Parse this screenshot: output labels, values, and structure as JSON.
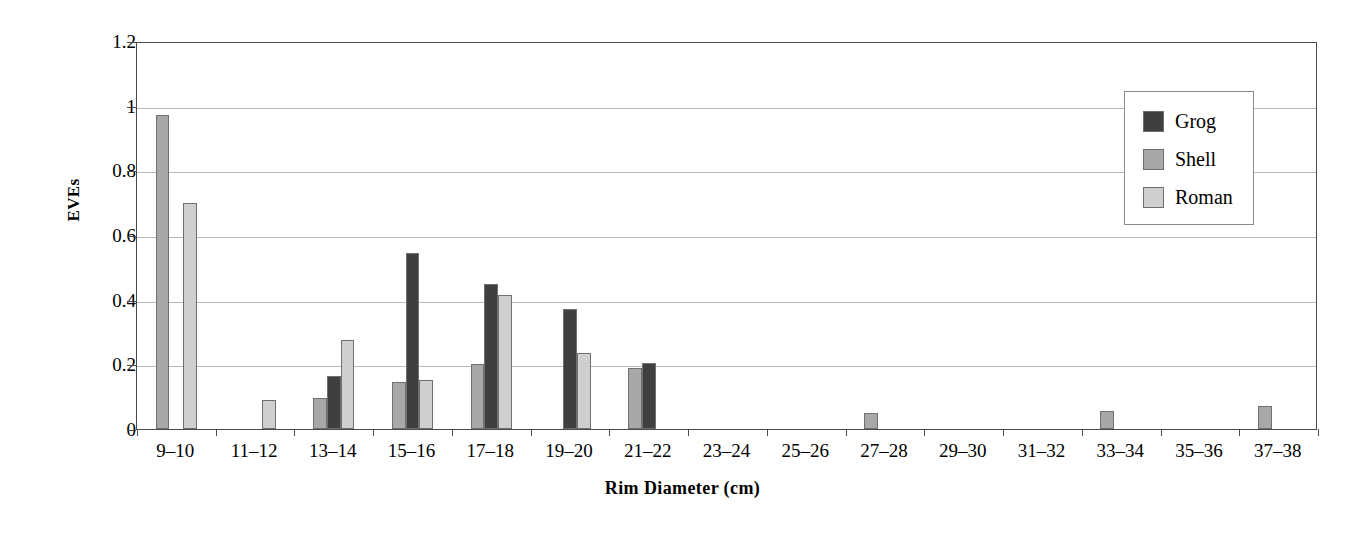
{
  "chart_data": {
    "type": "bar",
    "title": "",
    "xlabel": "Rim Diameter (cm)",
    "ylabel": "EVEs",
    "ylim": [
      0,
      1.2
    ],
    "yticks": [
      0,
      0.2,
      0.4,
      0.6,
      0.8,
      1,
      1.2
    ],
    "ytick_labels": [
      "0",
      "0.2",
      "0.4",
      "0.6",
      "0.8",
      "1",
      "1.2"
    ],
    "grid": true,
    "legend_position": "top-right",
    "categories": [
      "9–10",
      "11–12",
      "13–14",
      "15–16",
      "17–18",
      "19–20",
      "21–22",
      "23–24",
      "25–26",
      "27–28",
      "29–30",
      "31–32",
      "33–34",
      "35–36",
      "37–38"
    ],
    "series": [
      {
        "name": "Grog",
        "color": "#3f3f3f",
        "values": [
          0,
          0,
          0.165,
          0.545,
          0.45,
          0.37,
          0.205,
          0,
          0,
          0,
          0,
          0,
          0,
          0,
          0
        ]
      },
      {
        "name": "Shell",
        "color": "#a8a8a8",
        "values": [
          0.97,
          0,
          0.095,
          0.145,
          0.2,
          0,
          0.19,
          0,
          0,
          0.05,
          0,
          0,
          0.057,
          0,
          0.072
        ]
      },
      {
        "name": "Roman",
        "color": "#cfcfcf",
        "values": [
          0.7,
          0.09,
          0.275,
          0.152,
          0.415,
          0.235,
          0,
          0,
          0,
          0,
          0,
          0,
          0,
          0,
          0
        ]
      }
    ],
    "series_draw_order": [
      "Shell",
      "Grog",
      "Roman"
    ]
  },
  "legend": {
    "entries": [
      {
        "label": "Grog",
        "color": "#3f3f3f"
      },
      {
        "label": "Shell",
        "color": "#a8a8a8"
      },
      {
        "label": "Roman",
        "color": "#cfcfcf"
      }
    ]
  },
  "colors": {
    "grog": "#3f3f3f",
    "shell": "#a8a8a8",
    "roman": "#cfcfcf",
    "axis": "#4a4a4a",
    "gridline": "#b9b9b9",
    "background": "#ffffff"
  }
}
